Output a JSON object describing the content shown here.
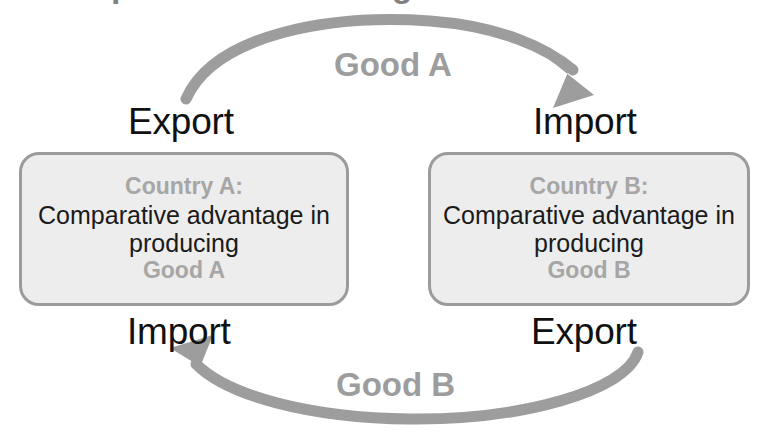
{
  "diagram": {
    "title_remnant": "Comparative Advantage and Trade",
    "colors": {
      "arrow": "#9d9d9d",
      "box_fill": "#ededed",
      "box_border": "#9b9b9b",
      "muted_text": "#a6a6a6",
      "body_text": "#1a1a1a",
      "label_text": "#111111",
      "background": "#ffffff"
    },
    "boxes": [
      {
        "id": "country-a",
        "heading": "Country A:",
        "body": "Comparative advantage in producing",
        "good": "Good A"
      },
      {
        "id": "country-b",
        "heading": "Country B:",
        "body": "Comparative advantage in producing",
        "good": "Good B"
      }
    ],
    "flows": [
      {
        "id": "good-a-flow",
        "label": "Good A",
        "source_label": "Export",
        "target_label": "Import",
        "direction": "left-to-right",
        "position": "top"
      },
      {
        "id": "good-b-flow",
        "label": "Good B",
        "source_label": "Export",
        "target_label": "Import",
        "direction": "right-to-left",
        "position": "bottom"
      }
    ],
    "labels": {
      "export_top_left": "Export",
      "import_top_right": "Import",
      "import_bottom_left": "Import",
      "export_bottom_right": "Export",
      "good_a_arc": "Good A",
      "good_b_arc": "Good B"
    }
  }
}
